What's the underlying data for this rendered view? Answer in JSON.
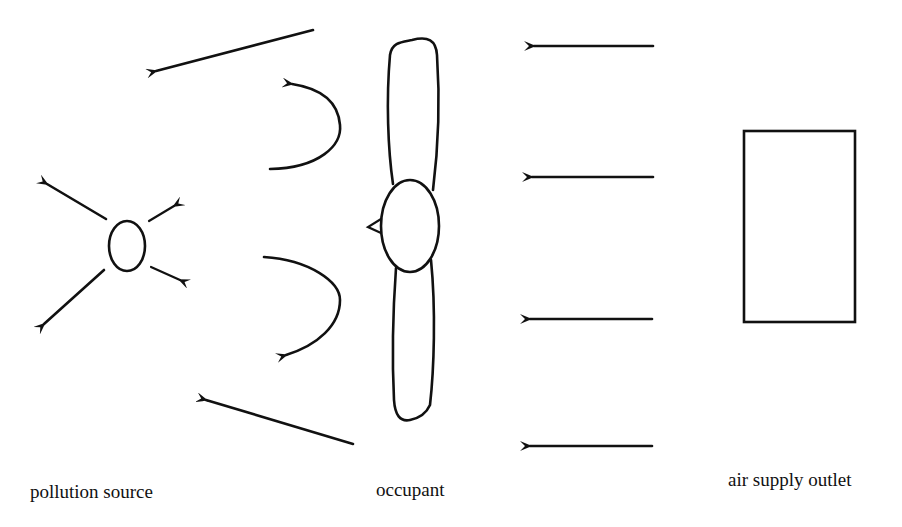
{
  "diagram": {
    "stroke_color": "#111111",
    "background": "#ffffff",
    "labels": {
      "pollution_source": "pollution source",
      "occupant": "occupant",
      "air_supply_outlet": "air supply outlet"
    },
    "nodes": [
      {
        "id": "pollution-source",
        "shape": "ellipse",
        "label": "pollution source"
      },
      {
        "id": "occupant",
        "shape": "figure (top view: head with shoulders/arms)",
        "label": "occupant"
      },
      {
        "id": "air-supply-outlet",
        "shape": "rectangle",
        "label": "air supply outlet"
      }
    ],
    "edges": [
      {
        "from": "air-supply-outlet",
        "to": "occupant",
        "kind": "supply airflow arrows (4, pointing left)"
      },
      {
        "from": "occupant",
        "to": "pollution-source",
        "kind": "wake/recirculation arrows (2 curved) and deflected flow (2 diagonal)"
      },
      {
        "from": "pollution-source",
        "to": "surroundings",
        "kind": "dispersion arrows (4 radiating)"
      }
    ]
  }
}
